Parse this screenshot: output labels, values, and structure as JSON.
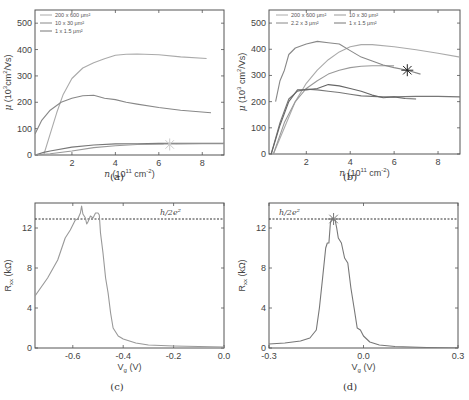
{
  "chart_data": [
    {
      "id": "a",
      "type": "line",
      "caption": "(a)",
      "xlabel": "n (10^11 cm^-2)",
      "ylabel": "μ (10^3 cm^2/Vs)",
      "xlim": [
        0.3,
        9
      ],
      "ylim": [
        0,
        550
      ],
      "xticks": [
        2,
        4,
        6,
        8
      ],
      "yticks": [
        0,
        100,
        200,
        300,
        400,
        500
      ],
      "legend": [
        "200 x 600 μm²",
        "10 x 30 μm²",
        "1 x 1.5 μm²"
      ],
      "series": [
        {
          "name": "200 x 600 μm²",
          "color": "#aaaaaa",
          "x": [
            0.7,
            1.0,
            1.3,
            1.6,
            2.0,
            2.5,
            3.0,
            3.5,
            4.0,
            4.5,
            5.0,
            6.0,
            7.0,
            8.2
          ],
          "y": [
            0,
            80,
            160,
            230,
            290,
            330,
            350,
            365,
            378,
            382,
            383,
            380,
            372,
            366
          ]
        },
        {
          "name": "10 x 30 μm²",
          "color": "#888888",
          "x": [
            0.3,
            0.6,
            1.0,
            1.5,
            2.0,
            2.5,
            3.0,
            3.5,
            4.0,
            4.5,
            5.0,
            6.0,
            7.0,
            8.4
          ],
          "y": [
            80,
            130,
            170,
            200,
            215,
            225,
            227,
            215,
            210,
            200,
            193,
            180,
            170,
            160
          ]
        },
        {
          "name": "1 x 1.5 μm²",
          "color": "#777777",
          "x": [
            0.3,
            0.7,
            1.0,
            2.0,
            3.0,
            4.0,
            5.0,
            6.0,
            7.0,
            8.0,
            9.0
          ],
          "y": [
            0,
            10,
            15,
            30,
            38,
            42,
            43,
            44,
            44,
            44,
            44
          ]
        },
        {
          "name": "extra",
          "color": "#999999",
          "x": [
            0.3,
            1.0,
            2.0,
            3.0,
            4.0,
            5.0,
            6.0,
            7.0,
            8.0,
            9.0
          ],
          "y": [
            0,
            5,
            15,
            28,
            35,
            40,
            41,
            42,
            43,
            43
          ]
        }
      ],
      "markers": [
        {
          "x": 6.5,
          "y": 40,
          "symbol": "asterisk",
          "color": "#cccccc"
        }
      ]
    },
    {
      "id": "b",
      "type": "line",
      "caption": "(b)",
      "xlabel": "n (10^11 cm^-2)",
      "ylabel": "μ (10^3 cm^2/Vs)",
      "xlim": [
        0.3,
        9
      ],
      "ylim": [
        0,
        550
      ],
      "xticks": [
        2,
        4,
        6,
        8
      ],
      "yticks": [
        0,
        100,
        200,
        300,
        400,
        500
      ],
      "legend": [
        "200 x 600 μm²",
        "10 x 30 μm²",
        "2.2 x 3 μm²",
        "1 x 1.5 μm²"
      ],
      "series": [
        {
          "name": "200 x 600 μm²",
          "color": "#aaaaaa",
          "x": [
            0.5,
            1.0,
            1.5,
            2.0,
            2.5,
            3.0,
            3.5,
            4.0,
            4.5,
            5.0,
            6.0,
            7.0,
            8.0,
            9.0
          ],
          "y": [
            0,
            100,
            200,
            270,
            320,
            360,
            390,
            410,
            418,
            418,
            410,
            398,
            385,
            370
          ]
        },
        {
          "name": "10 x 30 μm²",
          "color": "#999999",
          "x": [
            0.5,
            1.0,
            1.5,
            2.0,
            2.5,
            3.0,
            3.5,
            4.0,
            4.5,
            5.0,
            5.5,
            6.0
          ],
          "y": [
            0,
            120,
            200,
            250,
            280,
            305,
            320,
            330,
            335,
            337,
            337,
            337
          ]
        },
        {
          "name": "2.2 x 3 μm²",
          "color": "#888888",
          "x": [
            0.6,
            0.8,
            1.0,
            1.2,
            1.5,
            2.0,
            2.5,
            3.0,
            3.5,
            4.0,
            4.5,
            5.0,
            5.5,
            6.0,
            6.6,
            7.2
          ],
          "y": [
            200,
            280,
            320,
            380,
            405,
            420,
            430,
            425,
            420,
            395,
            370,
            355,
            340,
            330,
            320,
            305
          ]
        },
        {
          "name": "1 x 1.5 μm²",
          "color": "#777777",
          "x": [
            0.4,
            0.8,
            1.2,
            1.6,
            2.0,
            2.5,
            3.0,
            3.5,
            4.0,
            4.5,
            5.0,
            5.5,
            6.0,
            7.0,
            8.0,
            9.0
          ],
          "y": [
            0,
            120,
            210,
            240,
            248,
            245,
            240,
            235,
            228,
            222,
            220,
            218,
            218,
            220,
            220,
            218
          ]
        },
        {
          "name": "extra",
          "color": "#666666",
          "x": [
            0.4,
            0.8,
            1.2,
            1.6,
            2.0,
            2.5,
            3.0,
            3.5,
            4.0,
            4.5,
            5.0,
            5.5,
            6.0,
            6.5,
            7.0
          ],
          "y": [
            0,
            110,
            200,
            245,
            245,
            250,
            265,
            260,
            250,
            240,
            225,
            215,
            218,
            212,
            210
          ]
        }
      ],
      "markers": [
        {
          "x": 6.6,
          "y": 320,
          "symbol": "asterisk",
          "color": "#222222"
        }
      ]
    },
    {
      "id": "c",
      "type": "line",
      "caption": "(c)",
      "xlabel": "Vg (V)",
      "ylabel": "Rxx (kΩ)",
      "xlim": [
        -0.75,
        0.0
      ],
      "ylim": [
        0,
        14.5
      ],
      "xticks": [
        -0.6,
        -0.4,
        -0.2,
        0.0
      ],
      "xtick_labels": [
        "-0.6",
        "-0.4",
        "-0.2",
        "0.0"
      ],
      "yticks": [
        0,
        4,
        8,
        12
      ],
      "reference_line": {
        "y": 12.9,
        "label": "h/2e²"
      },
      "series": [
        {
          "name": "Rxx",
          "color": "#999999",
          "x": [
            -0.75,
            -0.7,
            -0.66,
            -0.63,
            -0.61,
            -0.59,
            -0.58,
            -0.57,
            -0.565,
            -0.56,
            -0.55,
            -0.545,
            -0.54,
            -0.53,
            -0.52,
            -0.51,
            -0.5,
            -0.495,
            -0.49,
            -0.48,
            -0.47,
            -0.46,
            -0.45,
            -0.44,
            -0.42,
            -0.4,
            -0.35,
            -0.3,
            -0.2,
            -0.1,
            0.0
          ],
          "y": [
            5.2,
            7.0,
            8.8,
            11.0,
            11.8,
            12.8,
            12.9,
            13.5,
            14.2,
            13.4,
            13.0,
            12.4,
            12.6,
            13.2,
            13.0,
            13.5,
            13.5,
            13.3,
            11.5,
            9.5,
            7.0,
            5.5,
            3.5,
            2.0,
            1.2,
            0.9,
            0.5,
            0.3,
            0.2,
            0.15,
            0.1
          ]
        }
      ]
    },
    {
      "id": "d",
      "type": "line",
      "caption": "(d)",
      "xlabel": "Vg (V)",
      "ylabel": "Rxx (kΩ)",
      "xlim": [
        -0.3,
        0.3
      ],
      "ylim": [
        0,
        14.5
      ],
      "xticks": [
        -0.3,
        0.0,
        0.3
      ],
      "xtick_labels": [
        "-0.3",
        "0.0",
        "0.3"
      ],
      "yticks": [
        0,
        4,
        8,
        12
      ],
      "reference_line": {
        "y": 12.9,
        "label": "h/2e²"
      },
      "series": [
        {
          "name": "Rxx",
          "color": "#777777",
          "x": [
            -0.3,
            -0.25,
            -0.2,
            -0.17,
            -0.15,
            -0.14,
            -0.13,
            -0.12,
            -0.115,
            -0.11,
            -0.105,
            -0.1,
            -0.095,
            -0.09,
            -0.085,
            -0.08,
            -0.07,
            -0.06,
            -0.05,
            -0.04,
            -0.03,
            -0.02,
            -0.01,
            0.0,
            0.02,
            0.05,
            0.1,
            0.2,
            0.3
          ],
          "y": [
            0.4,
            0.5,
            0.7,
            1.0,
            1.8,
            4.0,
            7.0,
            10.0,
            10.5,
            10.5,
            12.5,
            13.0,
            12.8,
            12.8,
            12.0,
            11.0,
            10.5,
            9.0,
            8.5,
            6.0,
            4.0,
            2.0,
            1.8,
            1.2,
            0.6,
            0.3,
            0.15,
            0.05,
            0.0
          ]
        }
      ],
      "markers": [
        {
          "x": -0.095,
          "y": 12.9,
          "symbol": "asterisk",
          "color": "#777777"
        }
      ]
    }
  ],
  "panels": {
    "a": {
      "caption": "(a)",
      "xlabel_prefix": "n",
      "xlabel_unit": "(10",
      "xlabel_exp": "11",
      "xlabel_rest": "cm",
      "ylabel": "μ (10³cm²/Vs)"
    },
    "b": {
      "caption": "(b)",
      "ylabel": "μ (10³ cm²/Vs)"
    },
    "c": {
      "caption": "(c)",
      "xlabel": "Vg (V)",
      "ylabel": "Rxx (kΩ)",
      "ref_label": "h/2e²"
    },
    "d": {
      "caption": "(d)",
      "xlabel": "Vg (V)",
      "ylabel": "Rxx (kΩ)",
      "ref_label": "h/2e²"
    }
  }
}
